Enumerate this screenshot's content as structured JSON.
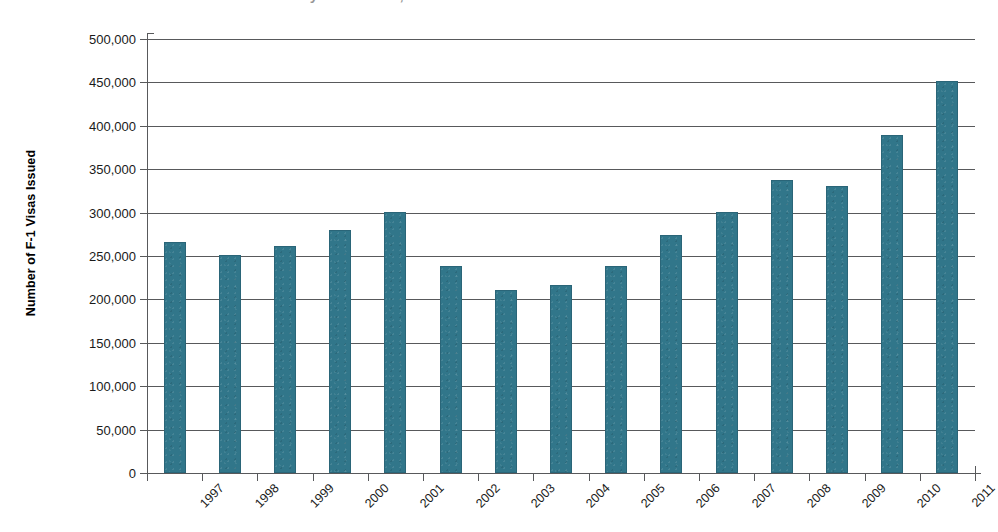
{
  "chart_data": {
    "type": "bar",
    "title": "",
    "xlabel": "",
    "ylabel": "Number of F-1 Visas Issued",
    "categories": [
      "1997",
      "1998",
      "1999",
      "2000",
      "2001",
      "2002",
      "2003",
      "2004",
      "2005",
      "2006",
      "2007",
      "2008",
      "2009",
      "2010",
      "2011"
    ],
    "values": [
      266000,
      251000,
      261000,
      280000,
      301000,
      238000,
      211000,
      217000,
      238000,
      274000,
      301000,
      338000,
      331000,
      389000,
      452000
    ],
    "ylim": [
      0,
      500000
    ],
    "ytick_values": [
      0,
      50000,
      100000,
      150000,
      200000,
      250000,
      300000,
      350000,
      400000,
      450000,
      500000
    ],
    "ytick_labels": [
      "0",
      "50,000",
      "100,000",
      "150,000",
      "200,000",
      "250,000",
      "300,000",
      "350,000",
      "400,000",
      "450,000",
      "500,000"
    ],
    "grid": true,
    "legend": false,
    "bar_color": "#31768a",
    "axis_color": "#58595b",
    "series": [
      {
        "name": "F-1 Visas Issued",
        "values": [
          266000,
          251000,
          261000,
          280000,
          301000,
          238000,
          211000,
          217000,
          238000,
          274000,
          301000,
          338000,
          331000,
          389000,
          452000
        ]
      }
    ]
  },
  "title_sliver": {
    "text": "Number of F-1 Student Visas Issued by Fiscal Year, 1997-2011"
  }
}
